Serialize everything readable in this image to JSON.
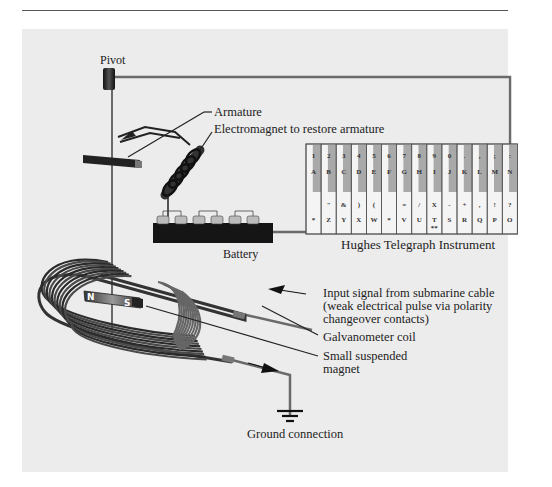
{
  "labels": {
    "pivot": "Pivot",
    "armature": "Armature",
    "electromagnet": "Electromagnet to restore armature",
    "battery": "Battery",
    "instrument": "Hughes Telegraph Instrument",
    "input_line1": "Input signal from submarine cable",
    "input_line2": "(weak electrical pulse via polarity",
    "input_line3": "changeover contacts)",
    "galvanometer": "Galvanometer coil",
    "magnet_line1": "Small suspended",
    "magnet_line2": "magnet",
    "ground": "Ground connection",
    "magnet_north": "N",
    "magnet_south": "S"
  },
  "keyboard": {
    "keys": [
      {
        "top": "1",
        "letter": "A",
        "lower_sym": "",
        "lower": "*"
      },
      {
        "top": "2",
        "letter": "B",
        "lower_sym": "\"",
        "lower": "Z"
      },
      {
        "top": "3",
        "letter": "C",
        "lower_sym": "&",
        "lower": "Y"
      },
      {
        "top": "4",
        "letter": "D",
        "lower_sym": ")",
        "lower": "X"
      },
      {
        "top": "5",
        "letter": "E",
        "lower_sym": "(",
        "lower": "W"
      },
      {
        "top": "6",
        "letter": "F",
        "lower_sym": "",
        "lower": "*"
      },
      {
        "top": "7",
        "letter": "G",
        "lower_sym": "=",
        "lower": "V"
      },
      {
        "top": "8",
        "letter": "H",
        "lower_sym": "/",
        "lower": "U"
      },
      {
        "top": "9",
        "letter": "I",
        "lower_sym": "X",
        "lower": "T",
        "extra": "**"
      },
      {
        "top": "0",
        "letter": "J",
        "lower_sym": "-",
        "lower": "S"
      },
      {
        "top": ".",
        "letter": "K",
        "lower_sym": "+",
        "lower": "R"
      },
      {
        "top": ",",
        "letter": "L",
        "lower_sym": ",",
        "lower": "Q"
      },
      {
        "top": ";",
        "letter": "M",
        "lower_sym": "!",
        "lower": "P"
      },
      {
        "top": ":",
        "letter": "N",
        "lower_sym": "?",
        "lower": "O"
      }
    ]
  },
  "colors": {
    "panel": "#ececec",
    "wire": "#6a6a6a",
    "dark": "#222222",
    "key_shade": "#a9a9a9",
    "key_light": "#f4f4f4"
  }
}
